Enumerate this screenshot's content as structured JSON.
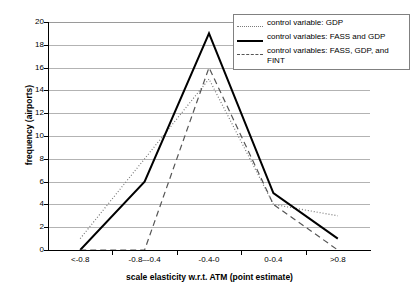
{
  "chart_data": {
    "type": "line",
    "title": "",
    "xlabel": "scale elasticity w.r.t. ATM (point estimate)",
    "ylabel": "frequency (airports)",
    "categories": [
      "<-0.8",
      "-0.8–-0.4",
      "-0.4-0",
      "0-0.4",
      ">0.8"
    ],
    "ylim": [
      0,
      20
    ],
    "ytick_step": 2,
    "yticks": [
      "20",
      "18",
      "16",
      "14",
      "12",
      "10",
      "8",
      "6",
      "4",
      "2",
      "0"
    ],
    "grid": "horizontal",
    "legend_position": "top-right",
    "series": [
      {
        "name": "control variable: GDP",
        "style": "dotted",
        "color": "#7a7a7a",
        "values": [
          1,
          8,
          15,
          4,
          3
        ]
      },
      {
        "name": "control variables: FASS and GDP",
        "style": "solid",
        "color": "#000000",
        "values": [
          0,
          6,
          19,
          5,
          1
        ]
      },
      {
        "name": "control variables: FASS, GDP, and FINT",
        "style": "dashed",
        "color": "#555555",
        "values": [
          0,
          0,
          16,
          4,
          0
        ]
      }
    ]
  },
  "legend": {
    "entries": [
      {
        "label": "control variable: GDP",
        "swatch": "dotted-line-swatch"
      },
      {
        "label": "control variables: FASS and GDP",
        "swatch": "solid-line-swatch"
      },
      {
        "label": "control variables: FASS, GDP, and FINT",
        "swatch": "dashed-line-swatch"
      }
    ]
  },
  "colors": {
    "gridline": "#b3b3b3",
    "axis": "#000000",
    "background": "#ffffff",
    "legend_border": "#808080"
  }
}
